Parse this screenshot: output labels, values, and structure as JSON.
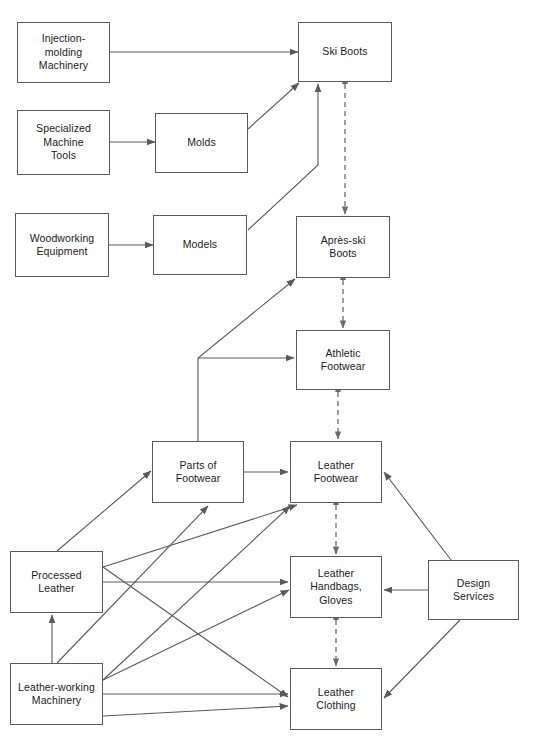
{
  "diagram": {
    "style": {
      "box_stroke": "#5a5a5a",
      "box_fill": "#ffffff",
      "edge_solid_color": "#5a5a5a",
      "edge_dashed_color": "#6b6b6b",
      "text_color": "#1a1a1a",
      "background": "#ffffff"
    },
    "nodes": [
      {
        "id": "injection",
        "label": "Injection-\nmolding\nMachinery",
        "x": 17,
        "y": 22,
        "w": 93,
        "h": 61
      },
      {
        "id": "specialized",
        "label": "Specialized\nMachine\nTools",
        "x": 17,
        "y": 110,
        "w": 93,
        "h": 65
      },
      {
        "id": "woodworking",
        "label": "Woodworking\nEquipment",
        "x": 15,
        "y": 213,
        "w": 94,
        "h": 64
      },
      {
        "id": "molds",
        "label": "Molds",
        "x": 155,
        "y": 113,
        "w": 93,
        "h": 60
      },
      {
        "id": "models",
        "label": "Models",
        "x": 153,
        "y": 215,
        "w": 94,
        "h": 60
      },
      {
        "id": "skiboots",
        "label": "Ski Boots",
        "x": 298,
        "y": 22,
        "w": 94,
        "h": 60
      },
      {
        "id": "apresski",
        "label": "Après-ski\nBoots",
        "x": 296,
        "y": 216,
        "w": 94,
        "h": 62
      },
      {
        "id": "athletic",
        "label": "Athletic\nFootwear",
        "x": 296,
        "y": 330,
        "w": 94,
        "h": 60
      },
      {
        "id": "parts",
        "label": "Parts of\nFootwear",
        "x": 152,
        "y": 441,
        "w": 92,
        "h": 62
      },
      {
        "id": "leatherfoot",
        "label": "Leather\nFootwear",
        "x": 290,
        "y": 441,
        "w": 92,
        "h": 62
      },
      {
        "id": "processed",
        "label": "Processed\nLeather",
        "x": 10,
        "y": 551,
        "w": 93,
        "h": 62
      },
      {
        "id": "handbags",
        "label": "Leather\nHandbags,\nGloves",
        "x": 290,
        "y": 556,
        "w": 92,
        "h": 62
      },
      {
        "id": "design",
        "label": "Design\nServices",
        "x": 428,
        "y": 560,
        "w": 91,
        "h": 60
      },
      {
        "id": "lwmachinery",
        "label": "Leather-working\nMachinery",
        "x": 10,
        "y": 663,
        "w": 93,
        "h": 62
      },
      {
        "id": "clothing",
        "label": "Leather\nClothing",
        "x": 290,
        "y": 668,
        "w": 92,
        "h": 62
      }
    ],
    "edges": [
      {
        "id": "e-injection-skiboots",
        "from": "injection",
        "to": "skiboots",
        "style": "solid",
        "arrow": "end",
        "points": "110,52 298,52"
      },
      {
        "id": "e-specialized-molds",
        "from": "specialized",
        "to": "molds",
        "style": "solid",
        "arrow": "end",
        "points": "110,142 155,142"
      },
      {
        "id": "e-woodworking-models",
        "from": "woodworking",
        "to": "models",
        "style": "solid",
        "arrow": "end",
        "points": "109,245 153,245"
      },
      {
        "id": "e-molds-skiboots",
        "from": "molds",
        "to": "skiboots",
        "style": "solid",
        "arrow": "end",
        "points": "248,129 299,83"
      },
      {
        "id": "e-models-skiboots",
        "from": "models",
        "to": "skiboots",
        "style": "solid",
        "arrow": "end",
        "points": "248,230 318,165 318,84"
      },
      {
        "id": "e-skiboots-apresski",
        "from": "skiboots",
        "to": "apresski",
        "style": "dashed",
        "arrow": "both",
        "points": "345,84 345,214"
      },
      {
        "id": "e-apresski-athletic",
        "from": "apresski",
        "to": "athletic",
        "style": "dashed",
        "arrow": "both",
        "points": "343,280 343,328"
      },
      {
        "id": "e-athletic-leatherfoot",
        "from": "athletic",
        "to": "leatherfoot",
        "style": "dashed",
        "arrow": "both",
        "points": "338,392 338,439"
      },
      {
        "id": "e-leatherfoot-handbags",
        "from": "leatherfoot",
        "to": "handbags",
        "style": "dashed",
        "arrow": "both",
        "points": "336,505 336,554"
      },
      {
        "id": "e-handbags-clothing",
        "from": "handbags",
        "to": "clothing",
        "style": "dashed",
        "arrow": "both",
        "points": "336,620 336,666"
      },
      {
        "id": "e-parts-apresski",
        "from": "parts",
        "to": "apresski",
        "style": "solid",
        "arrow": "end",
        "points": "198,441 198,358 295,279"
      },
      {
        "id": "e-parts-athletic",
        "from": "parts",
        "to": "athletic",
        "style": "solid",
        "arrow": "end",
        "points": "198,358 294,358"
      },
      {
        "id": "e-parts-leatherfoot",
        "from": "parts",
        "to": "leatherfoot",
        "style": "solid",
        "arrow": "end",
        "points": "244,472 288,472"
      },
      {
        "id": "e-processed-parts",
        "from": "processed",
        "to": "parts",
        "style": "solid",
        "arrow": "end",
        "points": "57,551 151,471"
      },
      {
        "id": "e-processed-handbags",
        "from": "processed",
        "to": "handbags",
        "style": "solid",
        "arrow": "end",
        "points": "103,582 288,582"
      },
      {
        "id": "e-processed-leatherfoot",
        "from": "processed",
        "to": "leatherfoot",
        "style": "solid",
        "arrow": "end",
        "points": "103,567 297,505"
      },
      {
        "id": "e-processed-clothing",
        "from": "processed",
        "to": "clothing",
        "style": "solid",
        "arrow": "end",
        "points": "103,567 288,697"
      },
      {
        "id": "e-lwmachinery-processed",
        "from": "lwmachinery",
        "to": "processed",
        "style": "solid",
        "arrow": "end",
        "points": "52,663 52,615"
      },
      {
        "id": "e-lwmachinery-parts",
        "from": "lwmachinery",
        "to": "parts",
        "style": "solid",
        "arrow": "end",
        "points": "57,663 208,506"
      },
      {
        "id": "e-lwmachinery-leatherfoot",
        "from": "lwmachinery",
        "to": "leatherfoot",
        "style": "solid",
        "arrow": "end",
        "points": "103,680 290,506"
      },
      {
        "id": "e-lwmachinery-handbags",
        "from": "lwmachinery",
        "to": "handbags",
        "style": "solid",
        "arrow": "end",
        "points": "103,680 289,590"
      },
      {
        "id": "e-lwmachinery-clothing",
        "from": "lwmachinery",
        "to": "clothing",
        "style": "solid",
        "arrow": "end",
        "points": "103,694 288,694"
      },
      {
        "id": "e-lwmachinery-clothing2",
        "from": "lwmachinery",
        "to": "clothing",
        "style": "solid",
        "arrow": "end",
        "points": "103,716 288,706"
      },
      {
        "id": "e-design-leatherfoot",
        "from": "design",
        "to": "leatherfoot",
        "style": "solid",
        "arrow": "end",
        "points": "451,560 384,472"
      },
      {
        "id": "e-design-handbags",
        "from": "design",
        "to": "handbags",
        "style": "solid",
        "arrow": "end",
        "points": "428,590 384,590"
      },
      {
        "id": "e-design-clothing",
        "from": "design",
        "to": "clothing",
        "style": "solid",
        "arrow": "end",
        "points": "460,620 384,698"
      }
    ]
  }
}
